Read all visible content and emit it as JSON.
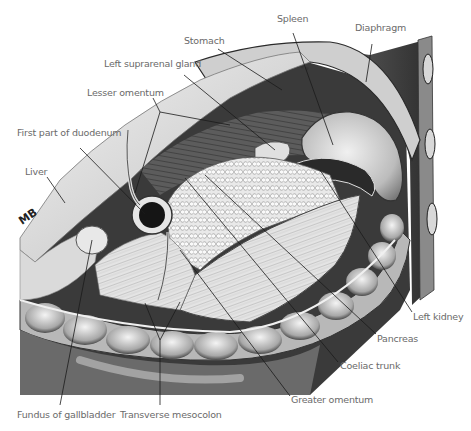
{
  "figure": {
    "signature": "MB",
    "colors": {
      "background": "#ffffff",
      "label_text": "#6a6a6a",
      "leader_line": "#1a1a1a"
    }
  },
  "labels": [
    {
      "id": "spleen",
      "text": "Spleen",
      "x": 277,
      "y": 19
    },
    {
      "id": "diaphragm",
      "text": "Diaphragm",
      "x": 355,
      "y": 28
    },
    {
      "id": "stomach",
      "text": "Stomach",
      "x": 184,
      "y": 41
    },
    {
      "id": "left-suprarenal-gland",
      "text": "Left suprarenal gland",
      "x": 104,
      "y": 64
    },
    {
      "id": "lesser-omentum",
      "text": "Lesser omentum",
      "x": 87,
      "y": 93
    },
    {
      "id": "first-part-of-duodenum",
      "text": "First part of duodenum",
      "x": 17,
      "y": 133
    },
    {
      "id": "liver",
      "text": "Liver",
      "x": 25,
      "y": 166
    },
    {
      "id": "left-kidney",
      "text": "Left kidney",
      "x": 413,
      "y": 313
    },
    {
      "id": "pancreas",
      "text": "Pancreas",
      "x": 377,
      "y": 335
    },
    {
      "id": "coeliac-trunk",
      "text": "Coeliac trunk",
      "x": 340,
      "y": 362
    },
    {
      "id": "greater-omentum",
      "text": "Greater omentum",
      "x": 291,
      "y": 396
    },
    {
      "id": "fundus-of-gallbladder",
      "text": "Fundus of gallbladder",
      "x": 17,
      "y": 411
    },
    {
      "id": "transverse-mesocolon",
      "text": "Transverse mesocolon",
      "x": 120,
      "y": 411
    }
  ]
}
